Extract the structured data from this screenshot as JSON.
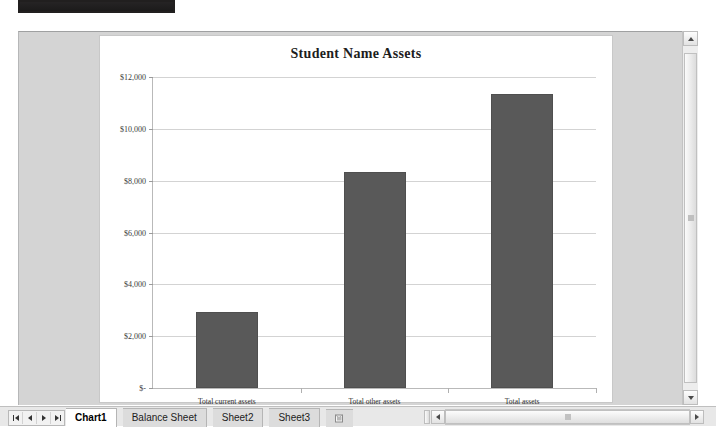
{
  "window": {
    "title_strip_label": ""
  },
  "chart_data": {
    "type": "bar",
    "title": "Student Name Assets",
    "categories": [
      "Total current assets",
      "Total other assets",
      "Total assets"
    ],
    "values": [
      2950,
      8350,
      11350
    ],
    "xlabel": "",
    "ylabel": "",
    "ylim": [
      0,
      12000
    ],
    "ytick_values": [
      12000,
      10000,
      8000,
      6000,
      4000,
      2000,
      0
    ],
    "ytick_labels": [
      "$12,000",
      "$10,000",
      "$8,000",
      "$6,000",
      "$4,000",
      "$2,000",
      "$-"
    ],
    "grid": true,
    "legend": false,
    "series_color": "#595959",
    "plot_background": "#ffffff"
  },
  "sheet_tabs": {
    "items": [
      {
        "label": "Chart1",
        "active": true
      },
      {
        "label": "Balance Sheet",
        "active": false
      },
      {
        "label": "Sheet2",
        "active": false
      },
      {
        "label": "Sheet3",
        "active": false
      }
    ],
    "new_sheet_icon": "new-sheet-icon",
    "nav": {
      "first": "first-sheet-icon",
      "previous": "previous-sheet-icon",
      "next": "next-sheet-icon",
      "last": "last-sheet-icon"
    }
  },
  "scrollbars": {
    "vertical": {
      "up_icon": "scroll-up-icon",
      "down_icon": "scroll-down-icon"
    },
    "horizontal": {
      "left_icon": "scroll-left-icon",
      "right_icon": "scroll-right-icon"
    }
  }
}
